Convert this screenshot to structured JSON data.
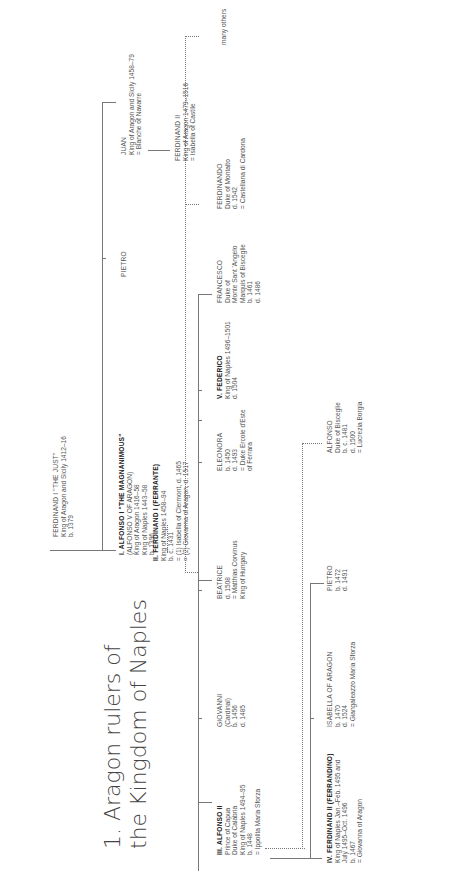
{
  "title": {
    "line1": "1. Aragon rulers of",
    "line2": "the Kingdom of Naples"
  },
  "nodes": {
    "ferdinand_i_just": {
      "name": "FERDINAND I \"THE JUST\"",
      "lines": [
        "King of Aragon and Sicily 1412–16",
        "b. 1379"
      ]
    },
    "alfonso_i": {
      "name": "I. ALFONSO I \"THE MAGNANIMOUS\"",
      "lines": [
        "(ALFONSO V OF ARAGON)",
        "King of Aragon 1416–58",
        "King of Naples 1443–58",
        "b. 1396"
      ]
    },
    "pietro_elder": {
      "name": "PIETRO",
      "lines": []
    },
    "juan": {
      "name": "JUAN",
      "lines": [
        "King of Aragon and Sicily 1458–79",
        "=  Blanche of Navarre"
      ]
    },
    "ferdinand_ii_aragon": {
      "name": "FERDINAND II",
      "lines": [
        "King of Aragon 1479–1516",
        "=  Isabella of Castile"
      ]
    },
    "ferrante": {
      "name": "II. FERDINAND I (FERRANTE)",
      "lines": [
        "King of Naples 1458–94",
        "b. c. 1431",
        "=  (1) Isabella of Clermont, d. 1465",
        "=  (2)  Giovanna of Aragon, d. 1517"
      ]
    },
    "alfonso_ii": {
      "name": "III. ALFONSO II",
      "lines": [
        "Prince of Capua",
        "Duke of Calabria",
        "King of Naples 1494–95",
        "b. 1448",
        "=  Ippolita Maria Sforza"
      ]
    },
    "giovanni": {
      "name": "GIOVANNI",
      "lines": [
        "(Cardinal)",
        "b. 1456",
        "d. 1485"
      ]
    },
    "beatrice": {
      "name": "BEATRICE",
      "lines": [
        "d. 1508",
        "=  Matthias Corvinus",
        "King of Hungary"
      ]
    },
    "eleonora": {
      "name": "ELEONORA",
      "lines": [
        "b. 1450",
        "d. 1493",
        "=  Duke Ercole d'Este",
        "of Ferrara"
      ]
    },
    "federico": {
      "name": "V. FEDERICO",
      "lines": [
        "King of Naples 1496–1501",
        "d. 1504"
      ]
    },
    "francesco": {
      "name": "FRANCESCO",
      "lines": [
        "Duke of",
        "Monte Sant 'Angelo",
        "Marquis of Bisceglie",
        "b. 1461",
        "d. 1486"
      ]
    },
    "ferdinando": {
      "name": "FERDINANDO",
      "lines": [
        "Duke of Montalto",
        "d. 1542",
        "=  Castellana di Cardona"
      ]
    },
    "many_others": {
      "name": "many others",
      "lines": []
    },
    "ferrandino": {
      "name": "IV. FERDINAND II (FERRANDINO)",
      "lines": [
        "King of Naples Jan.–Feb. 1495 and",
        "July 1495–Oct. 1496",
        "b. 1467",
        "=  Giovanna of Aragon"
      ]
    },
    "isabella": {
      "name": "ISABELLA OF ARAGON",
      "lines": [
        "b. 1470",
        "d. 1524",
        "=  Giangaleazzo Maria Sforza"
      ]
    },
    "pietro_younger": {
      "name": "PIETRO",
      "lines": [
        "b. 1472",
        "d. 1491"
      ]
    },
    "alfonso_bisceglie": {
      "name": "ALFONSO",
      "lines": [
        "Duke of Bisceglie",
        "b. c. 1481",
        "d. 1500",
        "=  Lucrezia Borgia"
      ]
    }
  }
}
